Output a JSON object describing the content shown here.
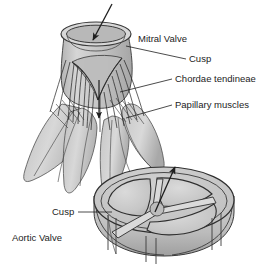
{
  "figure": {
    "background_color": "#ffffff",
    "width": 271,
    "height": 277,
    "ink_color": "#2b2b2b",
    "tissue_fill": "#c9c9c9",
    "tissue_shade": "#a9a9a9",
    "tissue_light": "#dcdcdc"
  },
  "labels": {
    "mitral_valve": "Mitral Valve",
    "cusp_upper": "Cusp",
    "chordae_tendineae": "Chordae tendineae",
    "papillary_muscles": "Papillary muscles",
    "cusp_lower": "Cusp",
    "aortic_valve": "Aortic Valve"
  },
  "structures": {
    "mitral": {
      "name": "Mitral Valve",
      "parts": [
        "annulus ring",
        "cusp",
        "chordae tendineae",
        "papillary muscles"
      ],
      "flow_arrow": "downward, inflow through valve orifice"
    },
    "aortic": {
      "name": "Aortic Valve",
      "parts": [
        "cylindrical ring",
        "three cusps",
        "commissures"
      ],
      "cusp_count": 3,
      "flow_arrow": "upward, outflow from valve center"
    }
  }
}
